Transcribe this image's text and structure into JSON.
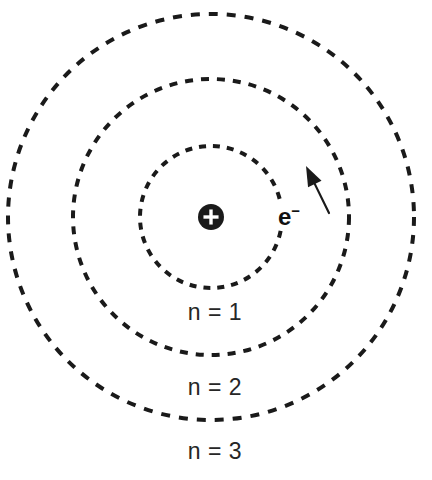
{
  "diagram": {
    "background_color": "#ffffff",
    "stroke_color": "#1a1a1a",
    "text_color": "#262626",
    "center": {
      "x": 211,
      "y": 217
    },
    "nucleus": {
      "symbol": "+",
      "charge_label": "+",
      "radius": 13,
      "fill_color": "#1a1a1a",
      "symbol_color": "#ffffff"
    },
    "electron": {
      "label": "e",
      "charge_superscript": "−",
      "label_x": 289,
      "label_y": 216
    },
    "direction_arrow": {
      "name": "orbit-direction-arrow",
      "from": {
        "x": 329,
        "y": 213
      },
      "to": {
        "x": 306,
        "y": 166
      }
    },
    "shells": [
      {
        "label": "n = 1",
        "quantum_number": 1,
        "radius": 71,
        "dash": "7 7",
        "stroke_width": 4,
        "label_x": 215,
        "label_y": 312
      },
      {
        "label": "n = 2",
        "quantum_number": 2,
        "radius": 138,
        "dash": "8 8",
        "stroke_width": 4,
        "label_x": 215,
        "label_y": 387
      },
      {
        "label": "n = 3",
        "quantum_number": 3,
        "radius": 203,
        "dash": "9 9",
        "stroke_width": 4,
        "label_x": 215,
        "label_y": 451
      }
    ]
  }
}
